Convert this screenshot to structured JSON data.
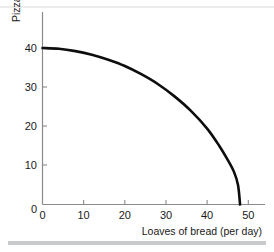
{
  "chart_data": {
    "type": "line",
    "title": "",
    "xlabel": "Loaves of bread (per day)",
    "ylabel": "Pizza (per day)",
    "xlim": [
      0,
      53
    ],
    "ylim": [
      0,
      50
    ],
    "xticks": [
      0,
      10,
      20,
      30,
      40,
      50
    ],
    "yticks": [
      0,
      10,
      20,
      30,
      40
    ],
    "xtick_labels": [
      "0",
      "10",
      "20",
      "30",
      "40",
      "50"
    ],
    "ytick_labels": [
      "0",
      "10",
      "20",
      "30",
      "40"
    ],
    "grid": false,
    "legend": null,
    "series": [
      {
        "name": "Production possibilities frontier",
        "x": [
          0,
          4,
          8,
          12,
          16,
          20,
          24,
          28,
          32,
          36,
          40,
          43,
          45,
          46.5,
          47.5,
          48
        ],
        "y": [
          40,
          39.8,
          39.2,
          38.3,
          37.0,
          35.4,
          33.3,
          30.8,
          27.7,
          24.0,
          19.4,
          14.9,
          11.4,
          8.4,
          5.0,
          0
        ]
      }
    ],
    "annotations": []
  },
  "axes": {
    "x": {
      "label": "Loaves of bread (per day)",
      "ticks": [
        {
          "value": 0,
          "label": "0"
        },
        {
          "value": 10,
          "label": "10"
        },
        {
          "value": 20,
          "label": "20"
        },
        {
          "value": 30,
          "label": "30"
        },
        {
          "value": 40,
          "label": "40"
        },
        {
          "value": 50,
          "label": "50"
        }
      ]
    },
    "y": {
      "label": "Pizza (per day)",
      "ticks": [
        {
          "value": 0,
          "label": "0"
        },
        {
          "value": 10,
          "label": "10"
        },
        {
          "value": 20,
          "label": "20"
        },
        {
          "value": 30,
          "label": "30"
        },
        {
          "value": 40,
          "label": "40"
        }
      ]
    }
  },
  "colors": {
    "curve": "#0d0d0d",
    "axis": "#8b8b8d",
    "text": "#1a1a1a",
    "background": "#ffffff",
    "rule": "#c9cacb"
  }
}
